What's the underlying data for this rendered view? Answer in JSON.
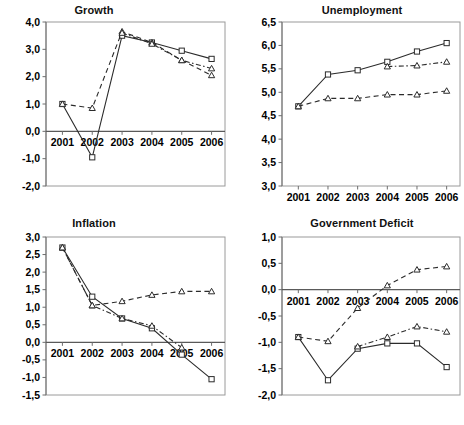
{
  "figure": {
    "background": "#ffffff",
    "foreground": "#000000",
    "panel_count": 4
  },
  "panels": [
    {
      "title": "Growth"
    },
    {
      "title": "Unemployment"
    },
    {
      "title": "Inflation"
    },
    {
      "title": "Government Deficit"
    }
  ],
  "chart_data": [
    {
      "type": "line",
      "title": "Growth",
      "xlabel": "",
      "ylabel": "",
      "categories": [
        "2001",
        "2002",
        "2003",
        "2004",
        "2005",
        "2006"
      ],
      "x": [
        2001,
        2002,
        2003,
        2004,
        2005,
        2006
      ],
      "ylim": [
        -2.0,
        4.0
      ],
      "yticks": [
        "-2,0",
        "-1,0",
        "0,0",
        "1,0",
        "2,0",
        "3,0",
        "4,0"
      ],
      "ytick_values": [
        -2.0,
        -1.0,
        0.0,
        1.0,
        2.0,
        3.0,
        4.0
      ],
      "grid": false,
      "legend": "none",
      "zero_line": true,
      "series": [
        {
          "name": "solid-square",
          "marker": "square",
          "linestyle": "solid",
          "values": [
            1.0,
            -0.95,
            3.5,
            3.25,
            2.95,
            2.65
          ]
        },
        {
          "name": "dashed-triangle",
          "marker": "triangle",
          "linestyle": "dashed",
          "values": [
            1.0,
            0.85,
            3.65,
            3.25,
            2.6,
            2.05
          ]
        },
        {
          "name": "dashdot-triangle",
          "marker": "triangle",
          "linestyle": "dashdot",
          "values": [
            null,
            null,
            3.6,
            3.2,
            2.6,
            2.3
          ]
        }
      ]
    },
    {
      "type": "line",
      "title": "Unemployment",
      "xlabel": "",
      "ylabel": "",
      "categories": [
        "2001",
        "2002",
        "2003",
        "2004",
        "2005",
        "2006"
      ],
      "x": [
        2001,
        2002,
        2003,
        2004,
        2005,
        2006
      ],
      "ylim": [
        3.0,
        6.5
      ],
      "yticks": [
        "3,0",
        "3,5",
        "4,0",
        "4,5",
        "5,0",
        "5,5",
        "6,0",
        "6,5"
      ],
      "ytick_values": [
        3.0,
        3.5,
        4.0,
        4.5,
        5.0,
        5.5,
        6.0,
        6.5
      ],
      "grid": false,
      "legend": "none",
      "zero_line": false,
      "series": [
        {
          "name": "solid-square",
          "marker": "square",
          "linestyle": "solid",
          "values": [
            4.7,
            5.38,
            5.47,
            5.65,
            5.87,
            6.05
          ]
        },
        {
          "name": "dashed-triangle",
          "marker": "triangle",
          "linestyle": "dashed",
          "values": [
            4.7,
            4.87,
            4.87,
            4.95,
            4.95,
            5.03
          ]
        },
        {
          "name": "dashdot-triangle",
          "marker": "triangle",
          "linestyle": "dashdot",
          "values": [
            null,
            null,
            null,
            5.55,
            5.57,
            5.65
          ]
        }
      ]
    },
    {
      "type": "line",
      "title": "Inflation",
      "xlabel": "",
      "ylabel": "",
      "categories": [
        "2001",
        "2002",
        "2003",
        "2004",
        "2005",
        "2006"
      ],
      "x": [
        2001,
        2002,
        2003,
        2004,
        2005,
        2006
      ],
      "ylim": [
        -1.5,
        3.0
      ],
      "yticks": [
        "-1,5",
        "-1,0",
        "-0,5",
        "0,0",
        "0,5",
        "1,0",
        "1,5",
        "2,0",
        "2,5",
        "3,0"
      ],
      "ytick_values": [
        -1.5,
        -1.0,
        -0.5,
        0.0,
        0.5,
        1.0,
        1.5,
        2.0,
        2.5,
        3.0
      ],
      "grid": false,
      "legend": "none",
      "zero_line": true,
      "series": [
        {
          "name": "solid-square",
          "marker": "square",
          "linestyle": "solid",
          "values": [
            2.7,
            1.3,
            0.68,
            0.4,
            -0.35,
            -1.05
          ]
        },
        {
          "name": "dashed-triangle",
          "marker": "triangle",
          "linestyle": "dashed",
          "values": [
            2.7,
            1.05,
            1.17,
            1.35,
            1.45,
            1.45
          ]
        },
        {
          "name": "dashdot-triangle",
          "marker": "triangle",
          "linestyle": "dashdot",
          "values": [
            2.7,
            1.05,
            0.68,
            0.47,
            -0.15,
            null
          ]
        }
      ]
    },
    {
      "type": "line",
      "title": "Government Deficit",
      "xlabel": "",
      "ylabel": "",
      "categories": [
        "2001",
        "2002",
        "2003",
        "2004",
        "2005",
        "2006"
      ],
      "x": [
        2001,
        2002,
        2003,
        2004,
        2005,
        2006
      ],
      "ylim": [
        -2.0,
        1.0
      ],
      "yticks": [
        "-2,0",
        "-1,5",
        "-1,0",
        "-0,5",
        "0,0",
        "0,5",
        "1,0"
      ],
      "ytick_values": [
        -2.0,
        -1.5,
        -1.0,
        -0.5,
        0.0,
        0.5,
        1.0
      ],
      "grid": false,
      "legend": "none",
      "zero_line": true,
      "series": [
        {
          "name": "solid-square",
          "marker": "square",
          "linestyle": "solid",
          "values": [
            -0.9,
            -1.72,
            -1.12,
            -1.02,
            -1.02,
            -1.47
          ]
        },
        {
          "name": "dashed-triangle-upper",
          "marker": "triangle",
          "linestyle": "dashed",
          "values": [
            -0.9,
            -0.98,
            -0.35,
            0.08,
            0.38,
            0.44
          ]
        },
        {
          "name": "dashdot-triangle",
          "marker": "triangle",
          "linestyle": "dashdot",
          "values": [
            null,
            null,
            -1.08,
            -0.9,
            -0.7,
            -0.8
          ]
        }
      ]
    }
  ]
}
